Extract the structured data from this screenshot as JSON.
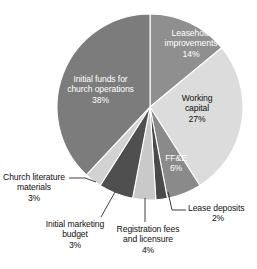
{
  "chart_data": {
    "type": "pie",
    "title": "",
    "subtitle": "",
    "xlabel": "",
    "ylabel": "",
    "legend_position": "none",
    "grid": false,
    "units": "percent",
    "total": 100,
    "categories": [
      "Leasehold improvements",
      "Working capital",
      "FF&E",
      "Lease deposits",
      "Registration fees and licensure",
      "Initial marketing budget",
      "Church literature materials",
      "Initial funds for church operations"
    ],
    "values": [
      14,
      27,
      6,
      2,
      4,
      6,
      3,
      38
    ],
    "slices": [
      {
        "label": "Leasehold improvements",
        "label_line1": "Leasehold",
        "label_line2": "improvements",
        "value": 14,
        "percent_text": "14%",
        "color": "#8f8f8f",
        "text_color": "#ffffff",
        "label_placement": "inside",
        "start_angle": 0,
        "end_angle": 50.4
      },
      {
        "label": "Working capital",
        "label_line1": "Working",
        "label_line2": "capital",
        "value": 27,
        "percent_text": "27%",
        "color": "#dcdcdc",
        "text_color": "#111111",
        "label_placement": "inside",
        "start_angle": 50.4,
        "end_angle": 147.6
      },
      {
        "label": "FF&E",
        "label_line1": "FF&E",
        "label_line2": "",
        "value": 6,
        "percent_text": "6%",
        "color": "#8a8a8a",
        "text_color": "#ffffff",
        "label_placement": "inside",
        "start_angle": 147.6,
        "end_angle": 169.2
      },
      {
        "label": "Lease deposits",
        "label_line1": "Lease deposits",
        "label_line2": "",
        "value": 2,
        "percent_text": "2%",
        "color": "#4a4a4a",
        "text_color": "#111111",
        "label_placement": "outside",
        "start_angle": 169.2,
        "end_angle": 176.4
      },
      {
        "label": "Registration fees and licensure",
        "label_line1": "Registration fees",
        "label_line2": "and licensure",
        "value": 4,
        "percent_text": "4%",
        "color": "#c9c9c9",
        "text_color": "#111111",
        "label_placement": "outside",
        "start_angle": 176.4,
        "end_angle": 190.8
      },
      {
        "label": "Initial marketing budget",
        "label_line1": "Initial marketing",
        "label_line2": "budget",
        "value": 6,
        "percent_text": "6%",
        "color": "#4f4f4f",
        "text_color": "#111111",
        "label_placement": "outside",
        "start_angle": 190.8,
        "end_angle": 212.4
      },
      {
        "label": "Church literature materials",
        "label_line1": "Church literature",
        "label_line2": "materials",
        "value": 3,
        "percent_text": "3%",
        "color": "#d2d2d2",
        "text_color": "#111111",
        "label_placement": "outside",
        "start_angle": 212.4,
        "end_angle": 223.2
      },
      {
        "label": "Initial funds for church operations",
        "label_line1": "Initial funds for",
        "label_line2": "church operations",
        "value": 38,
        "percent_text": "38%",
        "color": "#7c7c7c",
        "text_color": "#ffffff",
        "label_placement": "inside",
        "start_angle": 223.2,
        "end_angle": 360
      }
    ],
    "geometry": {
      "center_x": 150,
      "center_y": 107,
      "radius": 93
    },
    "background_color": "#ffffff"
  }
}
